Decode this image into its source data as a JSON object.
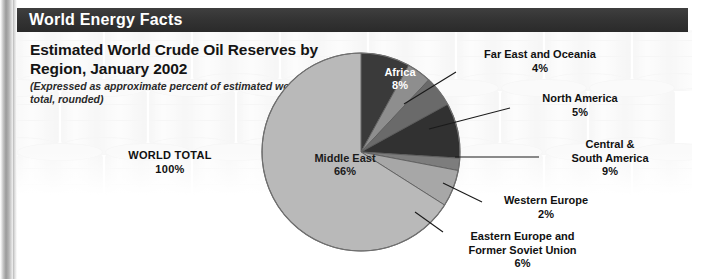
{
  "header": {
    "bar_title": "World Energy Facts",
    "bar_color": "#333333",
    "bar_text_color": "#ffffff"
  },
  "heading": {
    "title": "Estimated World Crude Oil Reserves by Region, January 2002",
    "subtitle": "(Expressed as approximate percent of estimated world total, rounded)"
  },
  "world_total": {
    "label": "WORLD TOTAL",
    "value": "100%"
  },
  "chart_data": {
    "type": "pie",
    "title": "Estimated World Crude Oil Reserves by Region, January 2002",
    "subtitle": "(Expressed as approximate percent of estimated world total, rounded)",
    "unit": "percent of estimated world total",
    "total_label": "WORLD TOTAL",
    "total_value": "100%",
    "legend": "none",
    "grid": false,
    "start_angle_deg": 0,
    "direction": "clockwise",
    "slices": [
      {
        "name": "Africa",
        "value": 8,
        "pct_label": "8%",
        "color": "#3a3a3a",
        "label_placement": "inside",
        "label_color": "#ffffff"
      },
      {
        "name": "Far East and Oceania",
        "value": 4,
        "pct_label": "4%",
        "color": "#8e8e8e",
        "label_placement": "outside",
        "label_color": "#111111"
      },
      {
        "name": "North America",
        "value": 5,
        "pct_label": "5%",
        "color": "#6a6a6a",
        "label_placement": "outside",
        "label_color": "#111111"
      },
      {
        "name": "Central & South America",
        "value": 9,
        "pct_label": "9%",
        "color": "#313131",
        "label_placement": "outside",
        "label_color": "#111111"
      },
      {
        "name": "Western Europe",
        "value": 2,
        "pct_label": "2%",
        "color": "#7d7d7d",
        "label_placement": "outside",
        "label_color": "#111111"
      },
      {
        "name": "Eastern Europe and Former Soviet Union",
        "value": 6,
        "pct_label": "6%",
        "color": "#a7a7a7",
        "label_placement": "outside",
        "label_color": "#111111"
      },
      {
        "name": "Middle East",
        "value": 66,
        "pct_label": "66%",
        "color": "#b9b9b9",
        "label_placement": "inside",
        "label_color": "#1b1b1b"
      }
    ]
  },
  "labels": {
    "middle_east": {
      "name": "Middle East",
      "pct": "66%"
    },
    "africa": {
      "name": "Africa",
      "pct": "8%"
    },
    "far_east": {
      "line1": "Far East and Oceania",
      "pct": "4%"
    },
    "north_america": {
      "line1": "North America",
      "pct": "5%"
    },
    "central_south_america": {
      "line1": "Central &",
      "line2": "South America",
      "pct": "9%"
    },
    "western_europe": {
      "line1": "Western Europe",
      "pct": "2%"
    },
    "eastern_europe": {
      "line1": "Eastern Europe and",
      "line2": "Former Soviet Union",
      "pct": "6%"
    }
  }
}
